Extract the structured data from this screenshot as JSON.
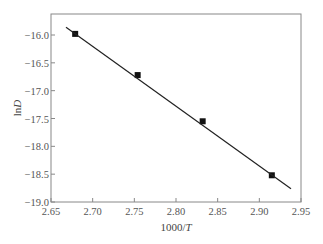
{
  "chart_data": {
    "type": "scatter",
    "title": "",
    "xlabel": "1000/T",
    "ylabel": "lnD",
    "xlim": [
      2.65,
      2.95
    ],
    "ylim": [
      -19.0,
      -15.7
    ],
    "xticks": [
      2.65,
      2.7,
      2.75,
      2.8,
      2.85,
      2.9,
      2.95
    ],
    "xtick_labels": [
      "2.65",
      "2.70",
      "2.75",
      "2.80",
      "2.85",
      "2.90",
      "2.95"
    ],
    "yticks": [
      -16.0,
      -16.5,
      -17.0,
      -17.5,
      -18.0,
      -18.5,
      -19.0
    ],
    "ytick_labels": [
      "−16.0",
      "−16.5",
      "−17.0",
      "−17.5",
      "−18.0",
      "−18.5",
      "−19.0"
    ],
    "grid": false,
    "legend": null,
    "series": [
      {
        "name": "measured",
        "marker": "square",
        "x": [
          2.679,
          2.754,
          2.832,
          2.915
        ],
        "y": [
          -15.98,
          -16.72,
          -17.55,
          -18.52
        ]
      },
      {
        "name": "linear fit",
        "style": "line",
        "x": [
          2.668,
          2.938
        ],
        "y": [
          -15.86,
          -18.76
        ]
      }
    ]
  }
}
